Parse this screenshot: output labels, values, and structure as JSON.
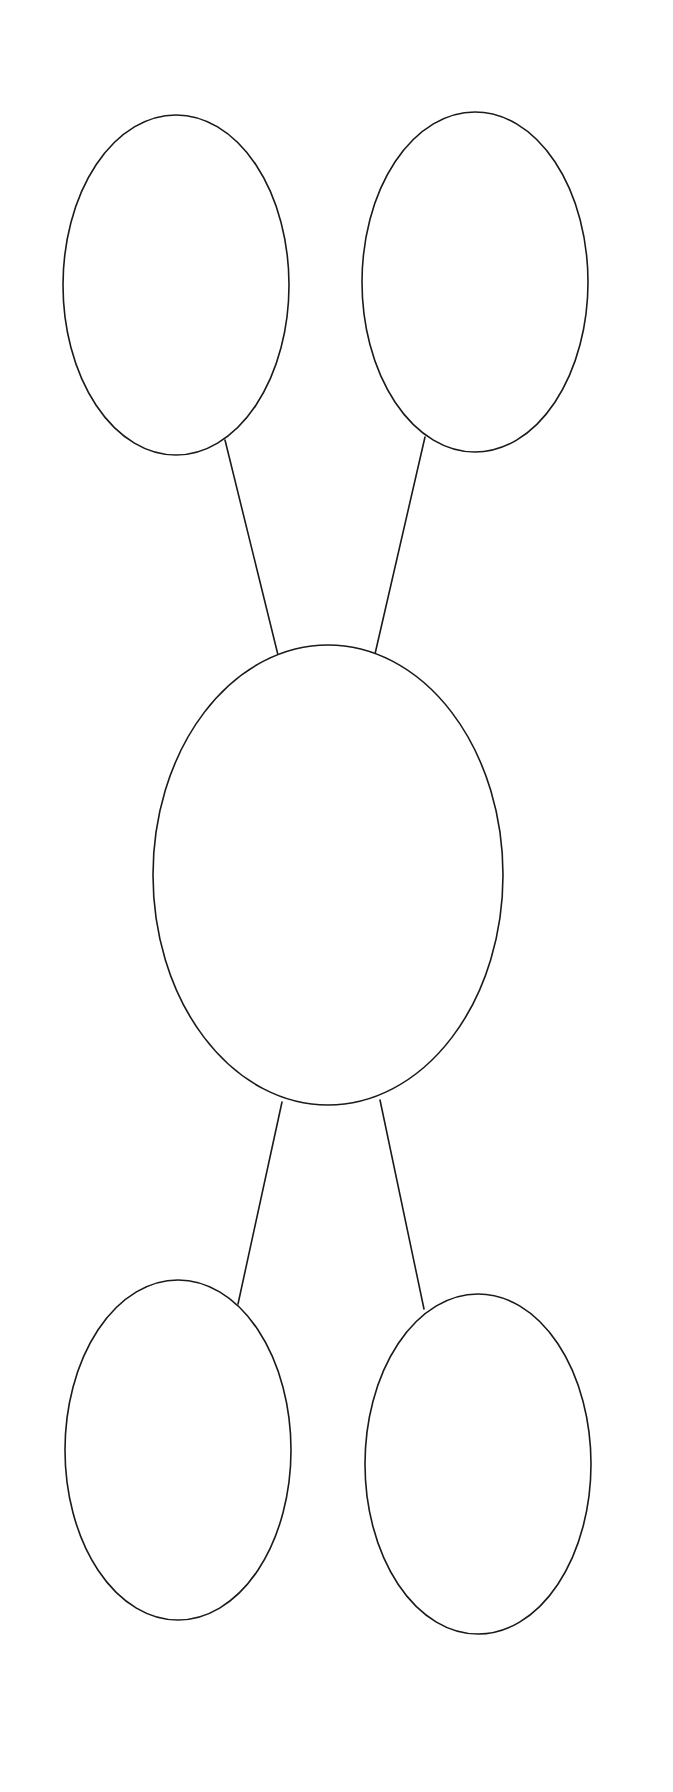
{
  "canvas": {
    "width": 673,
    "height": 1792,
    "background": "#ffffff"
  },
  "style": {
    "stroke": "#1a1a1a",
    "fill": "#ffffff",
    "stroke_width": 1.6
  },
  "diagram": {
    "type": "graphic-organizer",
    "nodes": [
      {
        "id": "top-left",
        "label": "",
        "cx": 176,
        "cy": 285,
        "rx": 113,
        "ry": 170
      },
      {
        "id": "top-right",
        "label": "",
        "cx": 475,
        "cy": 282,
        "rx": 113,
        "ry": 170
      },
      {
        "id": "center",
        "label": "",
        "cx": 328,
        "cy": 875,
        "rx": 175,
        "ry": 230
      },
      {
        "id": "bottom-left",
        "label": "",
        "cx": 178,
        "cy": 1450,
        "rx": 113,
        "ry": 170
      },
      {
        "id": "bottom-right",
        "label": "",
        "cx": 478,
        "cy": 1464,
        "rx": 113,
        "ry": 170
      }
    ],
    "edges": [
      {
        "from": "top-left",
        "to": "center",
        "x1": 225,
        "y1": 440,
        "x2": 278,
        "y2": 655
      },
      {
        "from": "top-right",
        "to": "center",
        "x1": 425,
        "y1": 437,
        "x2": 375,
        "y2": 654
      },
      {
        "from": "center",
        "to": "bottom-left",
        "x1": 282,
        "y1": 1102,
        "x2": 238,
        "y2": 1304
      },
      {
        "from": "center",
        "to": "bottom-right",
        "x1": 380,
        "y1": 1100,
        "x2": 424,
        "y2": 1309
      }
    ]
  }
}
